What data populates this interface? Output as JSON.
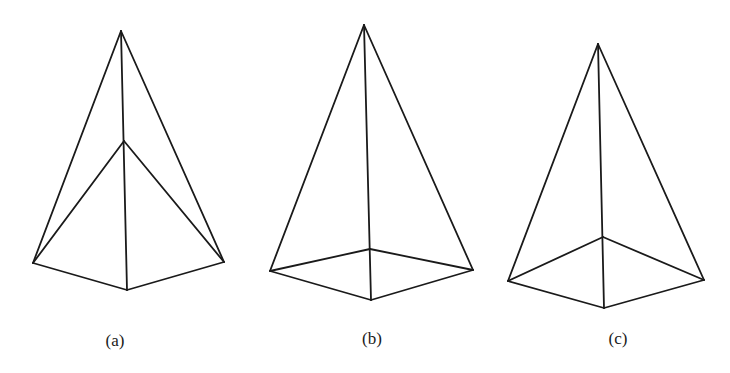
{
  "figures": [
    {
      "id": "a",
      "label": "(a)",
      "label_pos": [
        115,
        346
      ],
      "vertices": {
        "apex": [
          121,
          31
        ],
        "inner": [
          124,
          141
        ],
        "left": [
          33,
          263
        ],
        "bottom": [
          127,
          290
        ],
        "right": [
          224,
          262
        ]
      },
      "edges": [
        [
          "apex",
          "left"
        ],
        [
          "apex",
          "right"
        ],
        [
          "apex",
          "bottom"
        ],
        [
          "inner",
          "left"
        ],
        [
          "inner",
          "right"
        ],
        [
          "left",
          "bottom"
        ],
        [
          "bottom",
          "right"
        ]
      ]
    },
    {
      "id": "b",
      "label": "(b)",
      "label_pos": [
        372,
        344
      ],
      "vertices": {
        "apex": [
          364,
          25
        ],
        "back": [
          370,
          249
        ],
        "left": [
          270,
          271
        ],
        "bottom": [
          371,
          300
        ],
        "right": [
          473,
          270
        ]
      },
      "edges": [
        [
          "apex",
          "left"
        ],
        [
          "apex",
          "right"
        ],
        [
          "apex",
          "bottom"
        ],
        [
          "left",
          "back"
        ],
        [
          "back",
          "right"
        ],
        [
          "left",
          "bottom"
        ],
        [
          "bottom",
          "right"
        ]
      ]
    },
    {
      "id": "c",
      "label": "(c)",
      "label_pos": [
        618,
        344
      ],
      "vertices": {
        "apex": [
          598,
          44
        ],
        "back": [
          603,
          237
        ],
        "left": [
          508,
          281
        ],
        "bottom": [
          604,
          308
        ],
        "right": [
          704,
          280
        ]
      },
      "edges": [
        [
          "apex",
          "left"
        ],
        [
          "apex",
          "right"
        ],
        [
          "apex",
          "bottom"
        ],
        [
          "left",
          "back"
        ],
        [
          "back",
          "right"
        ],
        [
          "left",
          "bottom"
        ],
        [
          "bottom",
          "right"
        ]
      ]
    }
  ]
}
